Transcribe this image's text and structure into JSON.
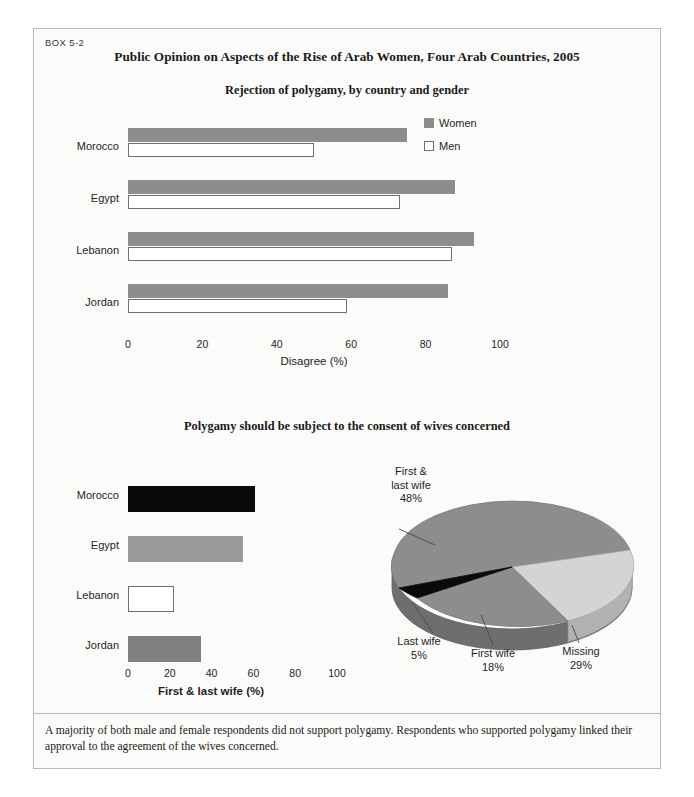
{
  "box": {
    "label": "BOX 5-2",
    "title": "Public Opinion on Aspects of the Rise of Arab Women, Four Arab Countries, 2005",
    "footnote": "A majority of both male and female respondents did not support polygamy. Respondents who supported polygamy linked their approval to the agreement of the wives concerned."
  },
  "colors": {
    "women_bar": "#8d8d8d",
    "men_bar": "#ffffff",
    "men_bar_border": "#6f6f6f",
    "morocco_bar": "#0a0a0a",
    "egypt_bar": "#9a9a9a",
    "lebanon_bar": "#ffffff",
    "jordan_bar": "#808080",
    "pie_major": "#8d8d8d",
    "pie_light": "#d4d4d4",
    "pie_dark": "#0a0a0a",
    "frame": "#b9b9b9",
    "page_bg": "#fbfbfa"
  },
  "chart_data": [
    {
      "type": "bar",
      "orientation": "horizontal",
      "title": "Rejection of polygamy, by country and gender",
      "categories": [
        "Morocco",
        "Egypt",
        "Lebanon",
        "Jordan"
      ],
      "series": [
        {
          "name": "Women",
          "values": [
            75,
            88,
            93,
            86
          ],
          "color": "#8d8d8d"
        },
        {
          "name": "Men",
          "values": [
            50,
            73,
            87,
            59
          ],
          "color": "#ffffff"
        }
      ],
      "legend": [
        "Women",
        "Men"
      ],
      "legend_position": "top-right",
      "xlabel": "Disagree (%)",
      "ylabel": "",
      "xlim": [
        0,
        100
      ],
      "xticks": [
        0,
        20,
        40,
        60,
        80,
        100
      ],
      "grid": false
    },
    {
      "type": "bar",
      "orientation": "horizontal",
      "title": "Polygamy should be subject to the consent of wives concerned",
      "categories": [
        "Morocco",
        "Egypt",
        "Lebanon",
        "Jordan"
      ],
      "values": [
        61,
        55,
        22,
        35
      ],
      "bar_colors": [
        "#0a0a0a",
        "#9a9a9a",
        "#ffffff",
        "#808080"
      ],
      "xlabel": "First & last wife (%)",
      "ylabel": "",
      "xlim": [
        0,
        100
      ],
      "xticks": [
        0,
        20,
        40,
        60,
        80,
        100
      ],
      "grid": false
    },
    {
      "type": "pie",
      "title": "",
      "labels": [
        "First & last wife",
        "Missing",
        "First wife",
        "Last wife"
      ],
      "values": [
        48,
        29,
        18,
        5
      ],
      "value_labels": [
        "48%",
        "29%",
        "18%",
        "5%"
      ],
      "colors": [
        "#8d8d8d",
        "#d4d4d4",
        "#8d8d8d",
        "#0a0a0a"
      ],
      "style": "3d",
      "legend_position": "callout-labels"
    }
  ],
  "chart1": {
    "title": "Rejection of polygamy, by country and gender",
    "xlabel": "Disagree (%)",
    "ticks": [
      "0",
      "20",
      "40",
      "60",
      "80",
      "100"
    ],
    "legend": {
      "women": "Women",
      "men": "Men"
    },
    "rows": [
      {
        "country": "Morocco",
        "women": 75,
        "men": 50
      },
      {
        "country": "Egypt",
        "women": 88,
        "men": 73
      },
      {
        "country": "Lebanon",
        "women": 93,
        "men": 87
      },
      {
        "country": "Jordan",
        "women": 86,
        "men": 59
      }
    ]
  },
  "chart2": {
    "title": "Polygamy should be subject to the consent of wives concerned",
    "xlabel": "First & last wife (%)",
    "ticks": [
      "0",
      "20",
      "40",
      "60",
      "80",
      "100"
    ],
    "rows": [
      {
        "country": "Morocco",
        "value": 61
      },
      {
        "country": "Egypt",
        "value": 55
      },
      {
        "country": "Lebanon",
        "value": 22
      },
      {
        "country": "Jordan",
        "value": 35
      }
    ]
  },
  "pie": {
    "slices": [
      {
        "name": "First & last wife",
        "line1": "First &",
        "line2": "last wife",
        "pct": "48%",
        "value": 48
      },
      {
        "name": "Missing",
        "line1": "Missing",
        "line2": "",
        "pct": "29%",
        "value": 29
      },
      {
        "name": "First wife",
        "line1": "First wife",
        "line2": "",
        "pct": "18%",
        "value": 18
      },
      {
        "name": "Last wife",
        "line1": "Last wife",
        "line2": "",
        "pct": "5%",
        "value": 5
      }
    ]
  }
}
